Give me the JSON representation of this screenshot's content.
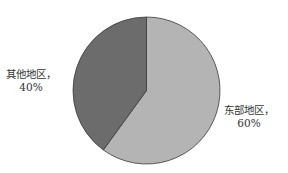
{
  "chart_data": {
    "type": "pie",
    "title": "",
    "categories": [
      "东部地区",
      "其他地区"
    ],
    "values": [
      60,
      40
    ],
    "unit": "%",
    "labels": [
      "东部地区，60%",
      "其他地区，40%"
    ],
    "colors": [
      "#b4b4b4",
      "#6c6c6c"
    ],
    "start_angle_deg": 0,
    "direction": "clockwise",
    "legend": "none",
    "data_labels": "outside"
  },
  "labels": [
    {
      "name": "东部地区，",
      "value": "60%"
    },
    {
      "name": "其他地区，",
      "value": "40%"
    }
  ]
}
